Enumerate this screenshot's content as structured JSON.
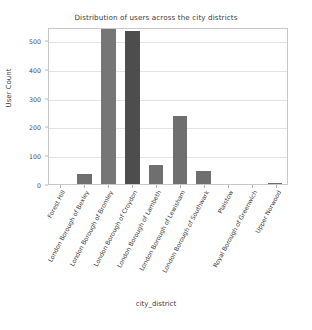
{
  "chart_data": {
    "type": "bar",
    "title": "Distribution of users across the city districts",
    "xlabel": "city_district",
    "ylabel": "User Count",
    "categories": [
      "Forest Hill",
      "London Borough of Bexley",
      "London Borough of Bromley",
      "London Borough of Croydon",
      "London Borough of Lambeth",
      "London Borough of Lewisham",
      "London Borough of Southwark",
      "Plaistow",
      "Royal Borough of Greenwich",
      "Upper Norwood"
    ],
    "values": [
      0,
      35,
      550,
      530,
      67,
      237,
      45,
      0,
      0,
      2
    ],
    "bar_colors": [
      "#6f6f6f",
      "#6f6f6f",
      "#767676",
      "#4d4d4d",
      "#6f6f6f",
      "#6f6f6f",
      "#6f6f6f",
      "#6f6f6f",
      "#6f6f6f",
      "#6f6f6f"
    ],
    "ylim": [
      0,
      545
    ],
    "yticks": [
      0,
      100,
      200,
      300,
      400,
      500
    ],
    "ytick_labels": [
      "0",
      "100",
      "200",
      "300",
      "400",
      "500"
    ],
    "grid": true,
    "legend": null
  }
}
